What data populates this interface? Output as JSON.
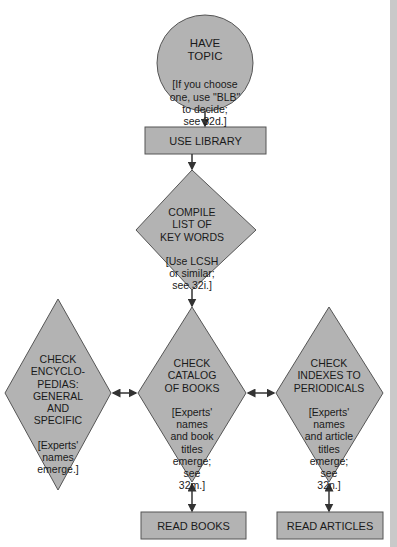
{
  "diagram": {
    "colors": {
      "fill": "#b3b3b3",
      "stroke": "#555555",
      "arrow": "#333333",
      "page_edge": "#c9c9c9"
    },
    "nodes": [
      {
        "id": "have-topic",
        "shape": "circle",
        "title": "HAVE\nTOPIC",
        "note": "[If you choose\none, use \"BLB\"\nto decide;\nsee 32d.]"
      },
      {
        "id": "use-library",
        "shape": "rectangle",
        "title": "USE LIBRARY"
      },
      {
        "id": "compile-key-words",
        "shape": "diamond",
        "title": "COMPILE\nLIST OF\nKEY WORDS",
        "note": "[Use LCSH\nor similar;\nsee 32i.]"
      },
      {
        "id": "check-encyclopedias",
        "shape": "diamond",
        "title": "CHECK\nENCYCLO-\nPEDIAS:\nGENERAL\nAND\nSPECIFIC",
        "note": "[Experts'\nnames\nemerge.]"
      },
      {
        "id": "check-catalog",
        "shape": "diamond",
        "title": "CHECK\nCATALOG\nOF BOOKS",
        "note": "[Experts'\nnames\nand book\ntitles\nemerge;\nsee\n32m.]"
      },
      {
        "id": "check-indexes",
        "shape": "diamond",
        "title": "CHECK\nINDEXES TO\nPERIODICALS",
        "note": "[Experts'\nnames\nand article\ntitles\nemerge;\nsee\n32n.]"
      },
      {
        "id": "read-books",
        "shape": "rectangle",
        "title": "READ BOOKS"
      },
      {
        "id": "read-articles",
        "shape": "rectangle",
        "title": "READ ARTICLES"
      }
    ],
    "edges": [
      {
        "from": "have-topic",
        "to": "use-library",
        "type": "one-way"
      },
      {
        "from": "use-library",
        "to": "compile-key-words",
        "type": "one-way"
      },
      {
        "from": "compile-key-words",
        "to": "check-catalog",
        "type": "one-way"
      },
      {
        "from": "check-encyclopedias",
        "to": "check-catalog",
        "type": "two-way"
      },
      {
        "from": "check-catalog",
        "to": "check-indexes",
        "type": "two-way"
      },
      {
        "from": "check-catalog",
        "to": "read-books",
        "type": "two-way"
      },
      {
        "from": "check-indexes",
        "to": "read-articles",
        "type": "two-way"
      }
    ]
  }
}
